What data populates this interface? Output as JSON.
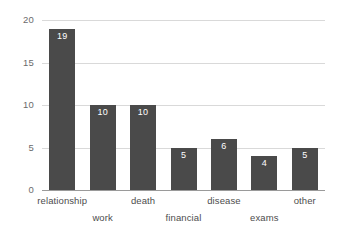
{
  "chart_data": {
    "type": "bar",
    "title": "",
    "subtitle": "",
    "xlabel": "",
    "ylabel": "",
    "categories": [
      "relationship",
      "work",
      "death",
      "financial",
      "disease",
      "exams",
      "other"
    ],
    "values": [
      19,
      10,
      10,
      5,
      6,
      4,
      5
    ],
    "value_labels": [
      "19",
      "10",
      "10",
      "5",
      "6",
      "4",
      "5"
    ],
    "ylim": [
      0,
      20
    ],
    "yticks": [
      0,
      5,
      10,
      15,
      20
    ],
    "ytick_labels": [
      "0",
      "5",
      "10",
      "15",
      "20"
    ],
    "grid": true,
    "grid_axis": "y",
    "legend": false,
    "legend_position": "none",
    "bar_color": "#4a4a4a",
    "value_label_color": "#ffffff",
    "gridline_color": "#d9d9d9",
    "axis_line_color": "#9a9a9a",
    "tick_label_color": "#6b6b6b",
    "category_label_color": "#4d4d4d",
    "background_color": "#ffffff",
    "category_label_rows": [
      0,
      1,
      0,
      1,
      0,
      1,
      0
    ]
  }
}
